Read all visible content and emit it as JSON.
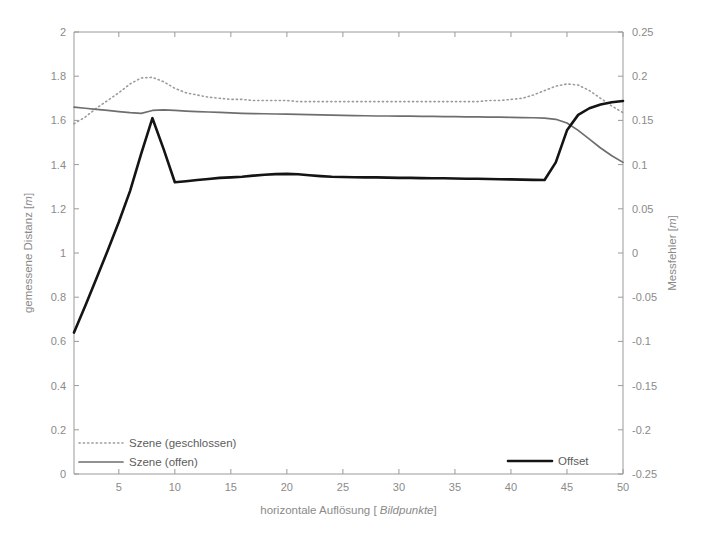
{
  "chart_data": {
    "type": "line",
    "title": "",
    "xlabel": "horizontale Auflösung [ Bildpunkte]",
    "xlabel_plain": "horizontale Auflösung [ ",
    "xlabel_emphasis": "Bildpunkte",
    "xlabel_tail": "]",
    "ylabel_left": "gemessene Distanz [m]",
    "ylabel_left_plain": "gemessene Distanz [",
    "ylabel_left_emphasis": "m",
    "ylabel_left_tail": "]",
    "ylabel_right": "Messfehler [m]",
    "ylabel_right_plain": "Messfehler [",
    "ylabel_right_emphasis": "m",
    "ylabel_right_tail": "]",
    "grid": false,
    "legend_position": "bottom-inside",
    "xlim": [
      1,
      50
    ],
    "xticks": [
      5,
      10,
      15,
      20,
      25,
      30,
      35,
      40,
      45,
      50
    ],
    "xtick_labels": [
      "5",
      "10",
      "15",
      "20",
      "25",
      "30",
      "35",
      "40",
      "45",
      "50"
    ],
    "ylim_left": [
      0,
      2
    ],
    "yticks_left": [
      0,
      0.2,
      0.4,
      0.6,
      0.8,
      1,
      1.2,
      1.4,
      1.6,
      1.8,
      2
    ],
    "ytick_labels_left": [
      "0",
      "0.2",
      "0.4",
      "0.6",
      "0.8",
      "1",
      "1.2",
      "1.4",
      "1.6",
      "1.8",
      "2"
    ],
    "ylim_right": [
      -0.25,
      0.25
    ],
    "yticks_right": [
      -0.25,
      -0.2,
      -0.15,
      -0.1,
      -0.05,
      0,
      0.05,
      0.1,
      0.15,
      0.2,
      0.25
    ],
    "ytick_labels_right": [
      "-0.25",
      "-0.2",
      "-0.15",
      "-0.1",
      "-0.05",
      "0",
      "0.05",
      "0.1",
      "0.15",
      "0.2",
      "0.25"
    ],
    "x": [
      1,
      2,
      3,
      4,
      5,
      6,
      7,
      8,
      9,
      10,
      11,
      12,
      13,
      14,
      15,
      16,
      17,
      18,
      19,
      20,
      21,
      22,
      23,
      24,
      25,
      26,
      27,
      28,
      29,
      30,
      31,
      32,
      33,
      34,
      35,
      36,
      37,
      38,
      39,
      40,
      41,
      42,
      43,
      44,
      45,
      46,
      47,
      48,
      49,
      50
    ],
    "series": [
      {
        "name": "Szene (geschlossen)",
        "style": "dotted",
        "color": "#9b9b9b",
        "axis": "left",
        "values": [
          1.585,
          1.615,
          1.655,
          1.69,
          1.725,
          1.765,
          1.792,
          1.795,
          1.775,
          1.745,
          1.725,
          1.715,
          1.705,
          1.7,
          1.695,
          1.695,
          1.69,
          1.69,
          1.69,
          1.69,
          1.685,
          1.685,
          1.685,
          1.685,
          1.685,
          1.685,
          1.685,
          1.685,
          1.685,
          1.685,
          1.685,
          1.685,
          1.685,
          1.685,
          1.685,
          1.685,
          1.685,
          1.69,
          1.69,
          1.695,
          1.7,
          1.715,
          1.735,
          1.755,
          1.765,
          1.76,
          1.735,
          1.7,
          1.665,
          1.635
        ]
      },
      {
        "name": "Szene (offen)",
        "style": "solid",
        "color": "#6e6e6e",
        "axis": "left",
        "values": [
          1.66,
          1.655,
          1.65,
          1.645,
          1.64,
          1.635,
          1.632,
          1.645,
          1.648,
          1.645,
          1.642,
          1.64,
          1.638,
          1.636,
          1.634,
          1.632,
          1.631,
          1.63,
          1.629,
          1.628,
          1.627,
          1.626,
          1.625,
          1.624,
          1.623,
          1.622,
          1.621,
          1.62,
          1.62,
          1.619,
          1.619,
          1.618,
          1.618,
          1.617,
          1.617,
          1.616,
          1.616,
          1.615,
          1.615,
          1.614,
          1.613,
          1.612,
          1.61,
          1.605,
          1.588,
          1.555,
          1.515,
          1.475,
          1.44,
          1.41
        ]
      },
      {
        "name": "Offset",
        "style": "solid-bold",
        "color": "#141414",
        "axis": "left",
        "values": [
          0.64,
          0.76,
          0.885,
          1.01,
          1.14,
          1.28,
          1.45,
          1.61,
          1.47,
          1.32,
          1.325,
          1.33,
          1.335,
          1.34,
          1.342,
          1.345,
          1.35,
          1.354,
          1.357,
          1.358,
          1.356,
          1.352,
          1.348,
          1.345,
          1.344,
          1.343,
          1.342,
          1.342,
          1.341,
          1.34,
          1.34,
          1.339,
          1.338,
          1.338,
          1.337,
          1.336,
          1.336,
          1.335,
          1.334,
          1.333,
          1.332,
          1.331,
          1.33,
          1.41,
          1.555,
          1.625,
          1.655,
          1.672,
          1.682,
          1.688
        ]
      }
    ]
  },
  "legend": {
    "entries": [
      {
        "label": "Szene (geschlossen)",
        "style": "dotted"
      },
      {
        "label": "Szene (offen)",
        "style": "solid"
      },
      {
        "label": "Offset",
        "style": "solid-bold"
      }
    ]
  }
}
